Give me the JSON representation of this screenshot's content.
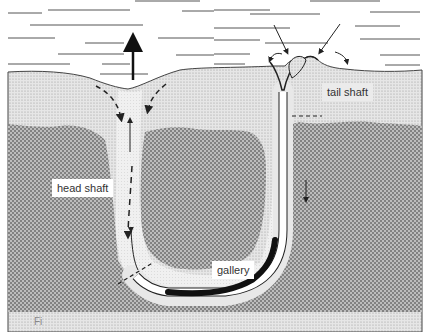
{
  "figure": {
    "labels": {
      "tail_shaft": "tail shaft",
      "head_shaft": "head shaft",
      "gallery": "gallery"
    },
    "caption_fragment": "Fi",
    "colors": {
      "water": "#ffffff",
      "water_lines": "#555555",
      "surface_sediment": "#dcdcdc",
      "deep_sediment": "#9a9a9a",
      "burrow_lining": "#ececec",
      "burrow_channel": "#ffffff",
      "worm": "#111111",
      "arrow": "#111111"
    },
    "annotations": {
      "water_flow_up_arrow": "upward outflow above head shaft",
      "inflow_arrows": "water drawn into tail shaft funnel",
      "outflow_arrows": "sediment ejected around funnel",
      "dashed_arrows": "sediment sinking into head shaft"
    }
  }
}
